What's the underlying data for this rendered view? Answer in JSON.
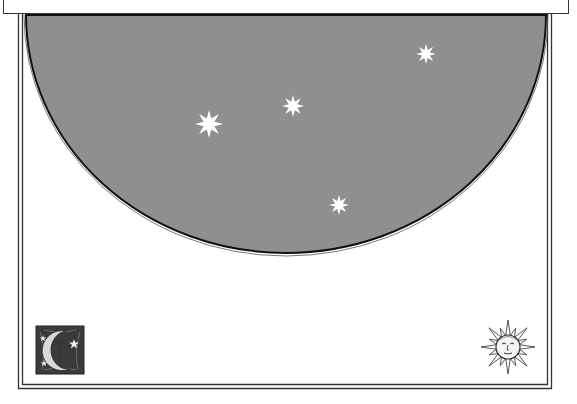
{
  "canvas": {
    "width": 577,
    "height": 404,
    "background": "#ffffff"
  },
  "top_bar": {
    "fill": "#ffffff",
    "stroke": "#333333"
  },
  "frame": {
    "stroke": "#333333",
    "outer": {
      "left": 18.5,
      "right": 551.5,
      "bottom": 388.5
    },
    "inner": {
      "left": 22.5,
      "right": 547.5,
      "bottom": 384.5
    }
  },
  "night_sky": {
    "fill": "#8f8f8f",
    "edge": "#111111",
    "cx": 286,
    "cy": 15,
    "rx": 260,
    "ry": 238
  },
  "stars": [
    {
      "name": "star-large",
      "cx": 209,
      "cy": 124,
      "r": 14,
      "color": "#ffffff"
    },
    {
      "name": "star-medium",
      "cx": 293,
      "cy": 106,
      "r": 11,
      "color": "#ffffff"
    },
    {
      "name": "star-top-right",
      "cx": 426,
      "cy": 54,
      "r": 10,
      "color": "#ffffff"
    },
    {
      "name": "star-lower",
      "cx": 339,
      "cy": 205,
      "r": 10,
      "color": "#ffffff"
    }
  ],
  "icons": {
    "moon": {
      "semantic": "crescent-moon-icon",
      "x": 36,
      "y": 326,
      "size": 48
    },
    "sun": {
      "semantic": "sun-face-icon",
      "cx": 508,
      "cy": 347,
      "r": 27
    }
  }
}
